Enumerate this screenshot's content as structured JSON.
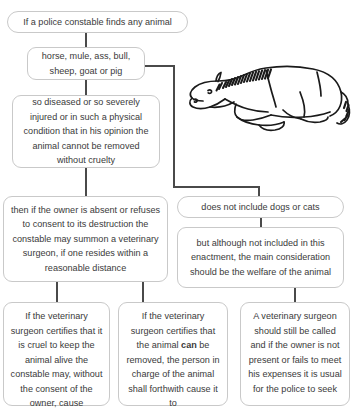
{
  "diagram": {
    "type": "flowchart",
    "nodes": [
      {
        "id": "finds-animal",
        "text": "If a police constable finds any animal",
        "shape": "pill"
      },
      {
        "id": "species",
        "text": "horse, mule, ass, bull, sheep, goat or pig",
        "shape": "rounded"
      },
      {
        "id": "condition",
        "text": "so diseased or so severely injured or in such a physical condition that in his opinion the animal cannot be removed without cruelty",
        "shape": "rounded"
      },
      {
        "id": "owner-absent",
        "text": "then if the owner is absent or refuses to consent to its destruction the constable may summon a veterinary surgeon, if one resides within a reasonable distance",
        "shape": "rounded"
      },
      {
        "id": "not-dogs-cats",
        "text": "does not include dogs or cats",
        "shape": "pill"
      },
      {
        "id": "welfare",
        "text": "but although not included in this enactment, the main consideration should be the welfare of the animal",
        "shape": "rounded"
      },
      {
        "id": "cruel-keep",
        "text": "If the veterinary surgeon certifies that it is cruel to keep the animal alive the constable may, without the consent of the owner, cause",
        "shape": "rounded",
        "truncated": true
      },
      {
        "id": "can-removed",
        "text_before_bold": "If the veterinary surgeon certifies that the animal ",
        "bold_word": "can",
        "text_after_bold": " be removed, the person in charge of the animal shall forthwith cause it to",
        "shape": "rounded",
        "truncated": true
      },
      {
        "id": "should-called",
        "text": "A veterinary surgeon should still be called and if the owner is not present or fails to meet his expenses it is usual for the police to seek",
        "shape": "rounded",
        "truncated": true
      }
    ],
    "illustration": {
      "name": "horse-lying-down",
      "description": "Line drawing of a horse lying down on its side"
    },
    "colors": {
      "background": "#ffffff",
      "box_border": "#c9c9c9",
      "text": "#3a3a3a",
      "connector": "#4a4a4a",
      "illustration_ink": "#1a1a1a"
    }
  }
}
